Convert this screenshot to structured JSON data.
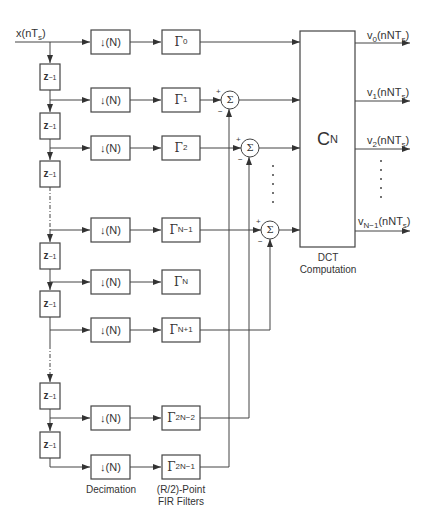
{
  "input": {
    "label": "x(nT",
    "sub": "s",
    "close": ")"
  },
  "delay": {
    "label": "z",
    "exp": "−1"
  },
  "decimator": {
    "label": "(N)",
    "arrow": "↓"
  },
  "filters": [
    {
      "sym": "Γ",
      "sub": "0"
    },
    {
      "sym": "Γ",
      "sub": "1"
    },
    {
      "sym": "Γ",
      "sub": "2"
    },
    {
      "sym": "Γ",
      "sub": "N−1"
    },
    {
      "sym": "Γ",
      "sub": "N"
    },
    {
      "sym": "Γ",
      "sub": "N+1"
    },
    {
      "sym": "Γ",
      "sub": "2N−2"
    },
    {
      "sym": "Γ",
      "sub": "2N−1"
    }
  ],
  "summer": {
    "symbol": "Σ",
    "plus": "+",
    "minus": "−"
  },
  "dct": {
    "main": "C",
    "sub": "N",
    "caption_line1": "DCT",
    "caption_line2": "Computation"
  },
  "outputs": [
    {
      "v": "v",
      "idx": "0",
      "arg": "(nNT",
      "s": "s",
      "close": ")"
    },
    {
      "v": "v",
      "idx": "1",
      "arg": "(nNT",
      "s": "s",
      "close": ")"
    },
    {
      "v": "v",
      "idx": "2",
      "arg": "(nNT",
      "s": "s",
      "close": ")"
    },
    {
      "v": "v",
      "idx": "N−1",
      "arg": "(nNT",
      "s": "s",
      "close": ")"
    }
  ],
  "captions": {
    "decimation": "Decimation",
    "fir_line1": "(R/2)-Point",
    "fir_line2": "FIR Filters"
  }
}
